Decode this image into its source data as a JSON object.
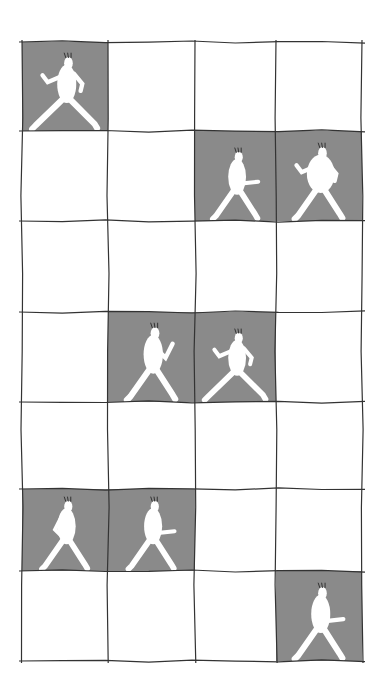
{
  "illustration": {
    "description": "Hand-drawn grid of 4 columns by 7 rows; some cells shaded gray contain white walking figures",
    "colors": {
      "background": "#ffffff",
      "shaded_cell": "#8a8a8a",
      "grid_line": "#333333",
      "figure": "#ffffff"
    },
    "grid": {
      "columns": 4,
      "rows": 7,
      "col_edges": [
        22,
        108,
        195,
        276,
        362
      ],
      "row_edges": [
        42,
        131,
        221,
        312,
        402,
        489,
        571,
        661
      ]
    },
    "shaded_cells": [
      {
        "row": 0,
        "col": 0,
        "figure": "walking-right-long-stride"
      },
      {
        "row": 1,
        "col": 2,
        "figure": "walking-right-arm-out"
      },
      {
        "row": 1,
        "col": 3,
        "figure": "walking-right-round-belly"
      },
      {
        "row": 3,
        "col": 1,
        "figure": "walking-right-arm-raised"
      },
      {
        "row": 3,
        "col": 2,
        "figure": "walking-right-long-stride"
      },
      {
        "row": 5,
        "col": 0,
        "figure": "walking-right-hands-behind"
      },
      {
        "row": 5,
        "col": 1,
        "figure": "walking-right-arm-out"
      },
      {
        "row": 6,
        "col": 3,
        "figure": "walking-right-swinging-arms"
      }
    ]
  }
}
